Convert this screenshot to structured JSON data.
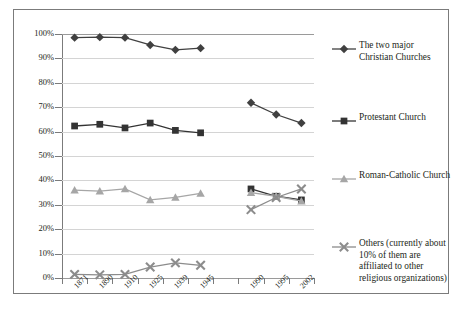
{
  "chart_data": {
    "type": "line",
    "title": "",
    "xlabel": "",
    "ylabel": "",
    "ylim": [
      0,
      100
    ],
    "ytick_labels": [
      "0%",
      "10%",
      "20%",
      "30%",
      "40%",
      "50%",
      "60%",
      "70%",
      "80%",
      "90%",
      "100%"
    ],
    "ytick_values": [
      0,
      10,
      20,
      30,
      40,
      50,
      60,
      70,
      80,
      90,
      100
    ],
    "grid": true,
    "legend_position": "right",
    "categories": [
      "1871",
      "1890",
      "1910",
      "1925",
      "1939",
      "1945",
      "",
      "1990",
      "1995",
      "2002"
    ],
    "series": [
      {
        "name": "The two major Christian Churches",
        "marker": "diamond",
        "color": "#404040",
        "values": [
          98.5,
          98.7,
          98.5,
          95.5,
          93.5,
          94.2,
          null,
          71.8,
          67.0,
          63.5
        ]
      },
      {
        "name": "Protestant Church",
        "marker": "square",
        "color": "#333333",
        "values": [
          62.3,
          63.0,
          61.5,
          63.5,
          60.5,
          59.5,
          null,
          36.5,
          33.5,
          32.0
        ]
      },
      {
        "name": "Roman-Catholic Church",
        "marker": "triangle",
        "color": "#a6a6a6",
        "values": [
          36.0,
          35.6,
          36.5,
          32.0,
          33.0,
          34.7,
          null,
          35.0,
          33.5,
          31.5
        ]
      },
      {
        "name": "Others (currently about 10% of them are affiliated to other religious organizations)",
        "marker": "cross",
        "color": "#8c8c8c",
        "values": [
          1.5,
          1.3,
          1.5,
          4.5,
          6.2,
          5.2,
          null,
          28.0,
          33.0,
          36.5
        ]
      }
    ]
  },
  "legend": {
    "entries": [
      {
        "lines": [
          "The two major",
          "Christian Churches"
        ]
      },
      {
        "lines": [
          "Protestant Church"
        ]
      },
      {
        "lines": [
          "Roman-Catholic Church"
        ]
      },
      {
        "lines": [
          "Others (currently about",
          "10% of them are",
          "affiliated to other",
          "religious organizations)"
        ]
      }
    ]
  }
}
